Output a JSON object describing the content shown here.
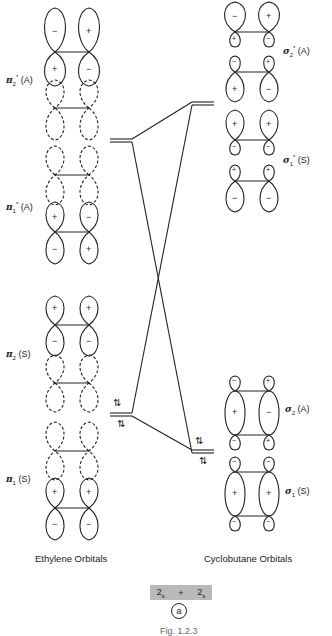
{
  "ethylene": {
    "title": "Ethylene  Orbitals",
    "orbitals": [
      {
        "label_main": "π",
        "sub": "2",
        "sup": "*",
        "sym": "(A)",
        "name": "pi2-star"
      },
      {
        "label_main": "π",
        "sub": "1",
        "sup": "*",
        "sym": "(A)",
        "name": "pi1-star"
      },
      {
        "label_main": "π",
        "sub": "2",
        "sup": "",
        "sym": "(S)",
        "name": "pi2"
      },
      {
        "label_main": "π",
        "sub": "1",
        "sup": "",
        "sym": "(S)",
        "name": "pi1"
      }
    ]
  },
  "cyclobutane": {
    "title": "Cyclobutane  Orbitals",
    "orbitals": [
      {
        "label_main": "σ",
        "sub": "2",
        "sup": "*",
        "sym": "(A)",
        "name": "sigma2-star"
      },
      {
        "label_main": "σ",
        "sub": "1",
        "sup": "*",
        "sym": "(S)",
        "name": "sigma1-star"
      },
      {
        "label_main": "σ",
        "sub": "2",
        "sup": "",
        "sym": "(A)",
        "name": "sigma2"
      },
      {
        "label_main": "σ",
        "sub": "1",
        "sup": "",
        "sym": "(S)",
        "name": "sigma1"
      }
    ]
  },
  "electrons": {
    "pair_symbol": "⇅"
  },
  "reaction": {
    "left": "2",
    "left_sub": "s",
    "op": "+",
    "right": "2",
    "right_sub": "s",
    "tag": "a"
  },
  "figure": {
    "caption": "Fig. 1.2.3"
  },
  "signs": {
    "plus": "+",
    "minus": "−"
  }
}
